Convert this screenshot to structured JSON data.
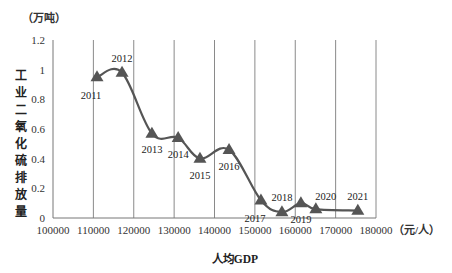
{
  "chart_data": {
    "type": "line",
    "title": "",
    "xlabel": "人均GDP",
    "x_unit": "（元/人）",
    "ylabel": "工业二氧化硫排放量",
    "y_unit": "（万吨）",
    "xlim": [
      100000,
      180000
    ],
    "ylim": [
      0,
      1.2
    ],
    "x_ticks": [
      100000,
      110000,
      120000,
      130000,
      140000,
      150000,
      160000,
      170000,
      180000
    ],
    "x_tick_labels": [
      "100000",
      "110000",
      "120000",
      "130000",
      "140000",
      "150000",
      "160000",
      "170000",
      "180000"
    ],
    "y_ticks": [
      0,
      0.2,
      0.4,
      0.6,
      0.8,
      1,
      1.2
    ],
    "y_tick_labels": [
      "0",
      "0.2",
      "0.4",
      "0.6",
      "0.8",
      "1",
      "1.2"
    ],
    "grid": {
      "vertical": true,
      "horizontal": false
    },
    "legend": null,
    "marker": "triangle",
    "line_color": "#555555",
    "marker_color": "#555555",
    "series": [
      {
        "name": "工业二氧化硫排放量",
        "points": [
          {
            "label": "2011",
            "x": 110900,
            "y": 0.95,
            "label_pos": "below-left"
          },
          {
            "label": "2012",
            "x": 117100,
            "y": 0.98,
            "label_pos": "above"
          },
          {
            "label": "2013",
            "x": 124500,
            "y": 0.57,
            "label_pos": "below"
          },
          {
            "label": "2014",
            "x": 131000,
            "y": 0.54,
            "label_pos": "below"
          },
          {
            "label": "2015",
            "x": 136400,
            "y": 0.4,
            "label_pos": "below"
          },
          {
            "label": "2016",
            "x": 143600,
            "y": 0.46,
            "label_pos": "below"
          },
          {
            "label": "2017",
            "x": 151500,
            "y": 0.12,
            "label_pos": "below-left"
          },
          {
            "label": "2018",
            "x": 156700,
            "y": 0.04,
            "label_pos": "above"
          },
          {
            "label": "2019",
            "x": 161400,
            "y": 0.1,
            "label_pos": "below"
          },
          {
            "label": "2020",
            "x": 165100,
            "y": 0.06,
            "label_pos": "above-right"
          },
          {
            "label": "2021",
            "x": 175500,
            "y": 0.05,
            "label_pos": "above"
          }
        ]
      }
    ]
  }
}
